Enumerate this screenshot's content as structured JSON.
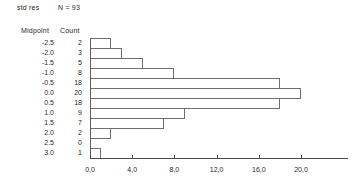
{
  "header": {
    "variable_label": "std res",
    "n_label": "N = 93"
  },
  "columns": {
    "midpoint_header": "Midpoint",
    "count_header": "Count"
  },
  "rows": [
    {
      "midpoint": "-2.5",
      "count": "2"
    },
    {
      "midpoint": "-2.0",
      "count": "3"
    },
    {
      "midpoint": "-1.5",
      "count": "5"
    },
    {
      "midpoint": "-1.0",
      "count": "8"
    },
    {
      "midpoint": "-0.5",
      "count": "18"
    },
    {
      "midpoint": "0.0",
      "count": "20"
    },
    {
      "midpoint": "0.5",
      "count": "18"
    },
    {
      "midpoint": "1.0",
      "count": "9"
    },
    {
      "midpoint": "1.5",
      "count": "7"
    },
    {
      "midpoint": "2.0",
      "count": "2"
    },
    {
      "midpoint": "2.5",
      "count": "0"
    },
    {
      "midpoint": "3.0",
      "count": "1"
    }
  ],
  "axis": {
    "tick_labels": [
      "0,0",
      "4,0",
      "8,0",
      "12,0",
      "16,0",
      "20,0"
    ],
    "tick_values": [
      0,
      4,
      8,
      12,
      16,
      20
    ]
  },
  "chart_data": {
    "type": "bar",
    "orientation": "horizontal",
    "title": "std res",
    "subtitle": "N = 93",
    "xlabel": "",
    "ylabel": "Midpoint",
    "categories": [
      "-2.5",
      "-2.0",
      "-1.5",
      "-1.0",
      "-0.5",
      "0.0",
      "0.5",
      "1.0",
      "1.5",
      "2.0",
      "2.5",
      "3.0"
    ],
    "values": [
      2,
      3,
      5,
      8,
      18,
      20,
      18,
      9,
      7,
      2,
      0,
      1
    ],
    "total_count": 93,
    "xlim": [
      0,
      24
    ],
    "xticks": [
      0,
      4,
      8,
      12,
      16,
      20
    ],
    "xticklabels": [
      "0,0",
      "4,0",
      "8,0",
      "12,0",
      "16,0",
      "20,0"
    ],
    "grid": false,
    "legend": false,
    "bar_fill": "none",
    "bar_edge_color": "#6e6e6e"
  }
}
